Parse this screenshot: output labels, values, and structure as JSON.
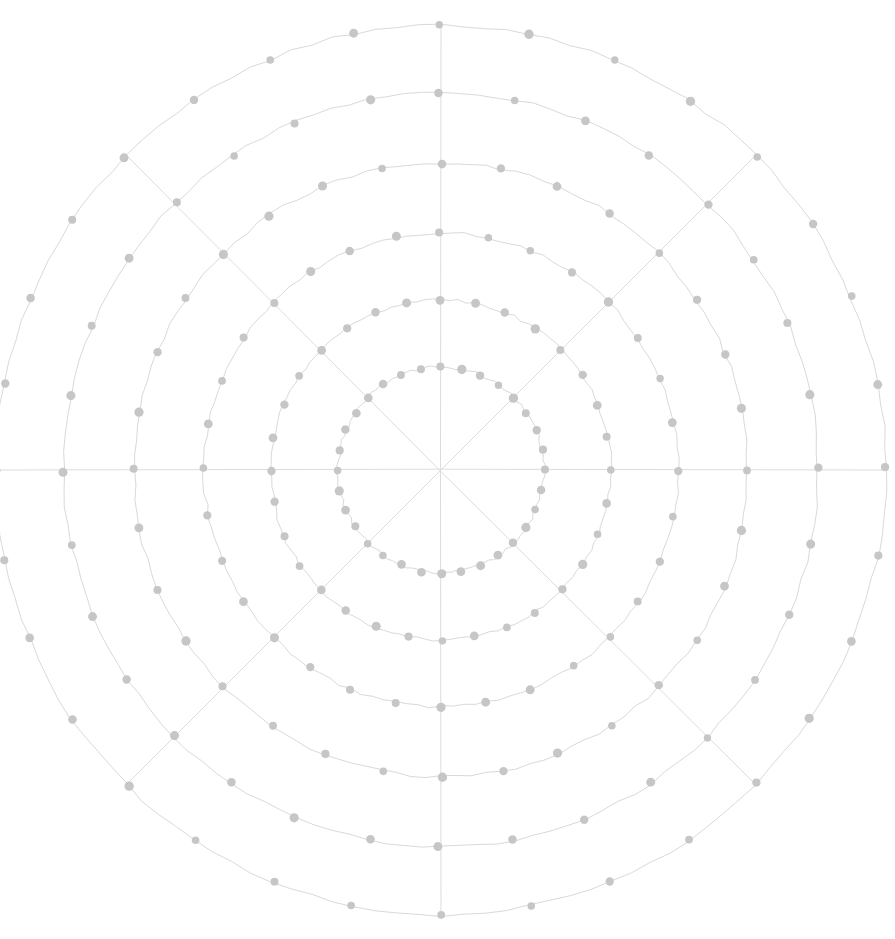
{
  "canvas": {
    "width": 895,
    "height": 939,
    "background": "#ffffff",
    "title": "Polar grid plot"
  },
  "style": {
    "ring_stroke": "#d9d9d9",
    "spoke_stroke": "#dcdcdc",
    "dot_fill": "#c6c6c6",
    "ring_stroke_width": 1.0,
    "spoke_stroke_width": 1.0,
    "dot_radius": 4.2,
    "hand_drawn_wobble": 1.6
  },
  "chart_data": {
    "type": "scatter",
    "title": "",
    "subtitle": "",
    "xlabel": "",
    "ylabel": "",
    "projection": "polar",
    "grid": true,
    "legend": null,
    "annotations": [],
    "center": {
      "x": 441,
      "y": 470
    },
    "radial_axis": {
      "label": "",
      "tick_labels": [],
      "rlim": [
        0,
        445
      ],
      "rings": [
        {
          "index": 1,
          "radius": 103,
          "dot_count": 32
        },
        {
          "index": 2,
          "radius": 170,
          "dot_count": 32
        },
        {
          "index": 3,
          "radius": 237,
          "dot_count": 32
        },
        {
          "index": 4,
          "radius": 307,
          "dot_count": 32
        },
        {
          "index": 5,
          "radius": 377,
          "dot_count": 32
        },
        {
          "index": 6,
          "radius": 445,
          "dot_count": 32
        }
      ]
    },
    "angular_axis": {
      "label": "",
      "tick_labels": [],
      "dot_angle_step_deg": 11.25,
      "dot_angles_deg": [
        0,
        11.25,
        22.5,
        33.75,
        45,
        56.25,
        67.5,
        78.75,
        90,
        101.25,
        112.5,
        123.75,
        135,
        146.25,
        157.5,
        168.75,
        180,
        191.25,
        202.5,
        213.75,
        225,
        236.25,
        247.5,
        258.75,
        270,
        281.25,
        292.5,
        303.75,
        315,
        326.25,
        337.5,
        348.75
      ],
      "spoke_angles_deg": [
        0,
        45,
        90,
        135,
        180,
        225,
        270,
        315
      ],
      "spoke_count": 8
    },
    "series": [
      {
        "name": "grid-vertices",
        "marker": "circle",
        "color": "#c6c6c6",
        "point_count": 192,
        "description": "32 angular positions on each of 6 concentric rings"
      }
    ]
  }
}
